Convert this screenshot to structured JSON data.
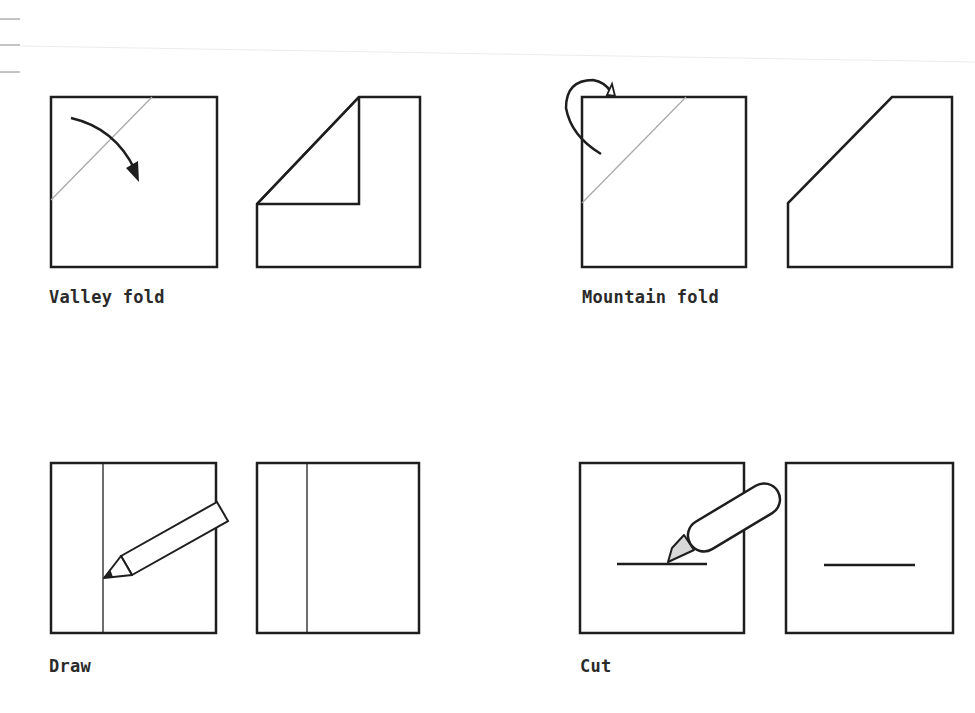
{
  "colors": {
    "line": "#1e1e1e",
    "crease": "#aaaaaa",
    "blade": "#d8d8d8",
    "background": "#ffffff",
    "label": "#2a2a2a"
  },
  "figures": [
    {
      "id": "valley-fold",
      "label": "Valley fold",
      "description": "Square with diagonal crease and curved arrow folding corner down; result shows folded corner flap"
    },
    {
      "id": "mountain-fold",
      "label": "Mountain fold",
      "description": "Square with diagonal crease and looping arrow folding corner behind; result shows truncated corner"
    },
    {
      "id": "draw",
      "label": "Draw",
      "description": "Square with vertical line drawn by pencil; result shows square with vertical line"
    },
    {
      "id": "cut",
      "label": "Cut",
      "description": "Square with horizontal line cut by craft knife; result shows square with horizontal cut"
    }
  ]
}
